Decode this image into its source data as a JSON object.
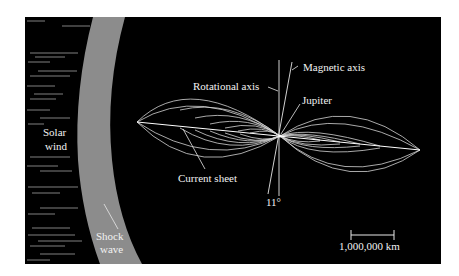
{
  "diagram": {
    "labels": {
      "solar_wind_line1": "Solar",
      "solar_wind_line2": "wind",
      "shock_wave_line1": "Shock",
      "shock_wave_line2": "wave",
      "rotational_axis": "Rotational axis",
      "magnetic_axis": "Magnetic axis",
      "jupiter": "Jupiter",
      "current_sheet": "Current sheet",
      "tilt_angle": "11°",
      "scale_bar": "1,000,000 km"
    },
    "colors": {
      "background": "#000000",
      "shock_wave_band": "#8c8c8c",
      "field_lines": "#d9d9d9",
      "text": "#f2f2f2",
      "page": "#ffffff"
    }
  }
}
